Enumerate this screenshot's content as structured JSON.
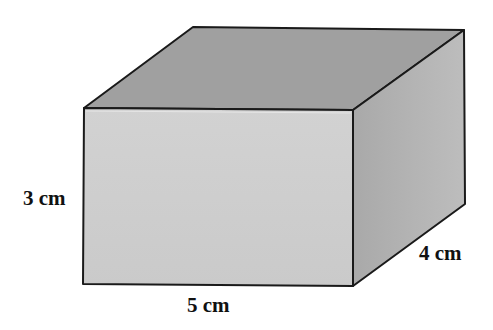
{
  "figure": {
    "type": "rectangular-prism",
    "colors": {
      "top_face": "#a0a0a0",
      "front_face": "#cecece",
      "side_face": "#b4b4b4",
      "side_face_dark": "#a8a8a8",
      "edge": "#1a1a1a",
      "background": "#ffffff"
    },
    "dimensions": {
      "height": {
        "value": 3,
        "unit": "cm",
        "label": "3 cm"
      },
      "length": {
        "value": 5,
        "unit": "cm",
        "label": "5 cm"
      },
      "width": {
        "value": 4,
        "unit": "cm",
        "label": "4 cm"
      }
    }
  }
}
